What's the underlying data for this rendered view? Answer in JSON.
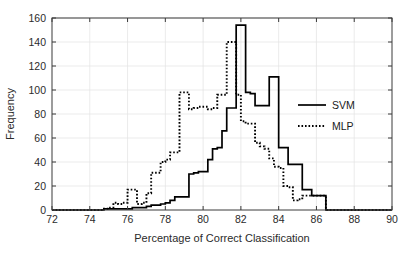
{
  "chart_data": {
    "type": "line",
    "title": "",
    "xlabel": "Percentage of Correct Classification",
    "ylabel": "Frequency",
    "xlim": [
      72,
      90
    ],
    "ylim": [
      0,
      160
    ],
    "xticks": [
      72,
      74,
      76,
      78,
      80,
      82,
      84,
      86,
      88,
      90
    ],
    "yticks": [
      0,
      20,
      40,
      60,
      80,
      100,
      120,
      140,
      160
    ],
    "grid": true,
    "legend_position": "right",
    "legend": [
      {
        "name": "SVM",
        "style": "solid",
        "color": "#000000"
      },
      {
        "name": "MLP",
        "style": "dotted",
        "color": "#000000"
      }
    ],
    "step_type": "post",
    "bin_width": 0.25,
    "series": [
      {
        "name": "SVM",
        "style": "solid",
        "color": "#000000",
        "x": [
          72.0,
          74.5,
          74.75,
          75.0,
          75.25,
          75.5,
          75.75,
          76.0,
          76.25,
          76.5,
          76.75,
          77.0,
          77.25,
          77.5,
          77.75,
          78.0,
          78.25,
          78.5,
          78.75,
          79.0,
          79.25,
          79.5,
          79.75,
          80.0,
          80.25,
          80.5,
          80.75,
          81.0,
          81.25,
          81.5,
          81.75,
          82.0,
          82.25,
          82.5,
          82.75,
          83.0,
          83.25,
          83.5,
          83.75,
          84.0,
          84.25,
          84.5,
          84.75,
          85.0,
          85.25,
          85.5,
          85.75,
          86.0,
          86.25,
          86.5,
          86.75,
          90.0
        ],
        "values": [
          0,
          0,
          1,
          1,
          1,
          1,
          1,
          1,
          2,
          2,
          2,
          3,
          4,
          4,
          5,
          6,
          8,
          11,
          11,
          11,
          30,
          31,
          32,
          32,
          42,
          51,
          52,
          66,
          85,
          85,
          154,
          154,
          98,
          97,
          87,
          87,
          87,
          111,
          111,
          52,
          52,
          38,
          38,
          38,
          17,
          17,
          12,
          12,
          12,
          0,
          0,
          0
        ]
      },
      {
        "name": "MLP",
        "style": "dotted",
        "color": "#000000",
        "x": [
          72.0,
          74.5,
          74.75,
          75.0,
          75.25,
          75.5,
          75.75,
          76.0,
          76.25,
          76.5,
          76.75,
          77.0,
          77.25,
          77.5,
          77.75,
          78.0,
          78.25,
          78.5,
          78.75,
          79.0,
          79.25,
          79.5,
          79.75,
          80.0,
          80.25,
          80.5,
          80.75,
          81.0,
          81.25,
          81.5,
          81.75,
          82.0,
          82.25,
          82.5,
          82.75,
          83.0,
          83.25,
          83.5,
          83.75,
          84.0,
          84.25,
          84.5,
          84.75,
          85.0,
          85.25,
          86.5,
          90.0
        ],
        "values": [
          0,
          0,
          1,
          2,
          6,
          5,
          6,
          17,
          17,
          5,
          6,
          14,
          31,
          31,
          40,
          42,
          48,
          48,
          98,
          98,
          84,
          85,
          86,
          86,
          84,
          85,
          96,
          96,
          140,
          140,
          96,
          74,
          72,
          72,
          56,
          53,
          51,
          43,
          36,
          35,
          20,
          19,
          8,
          9,
          12,
          0,
          0
        ]
      }
    ]
  },
  "axes": {
    "x_tick_labels": [
      "72",
      "74",
      "76",
      "78",
      "80",
      "82",
      "84",
      "86",
      "88",
      "90"
    ],
    "y_tick_labels": [
      "0",
      "20",
      "40",
      "60",
      "80",
      "100",
      "120",
      "140",
      "160"
    ],
    "x_title": "Percentage of Correct Classification",
    "y_title": "Frequency"
  },
  "legend": {
    "items": [
      {
        "label": "SVM"
      },
      {
        "label": "MLP"
      }
    ]
  }
}
